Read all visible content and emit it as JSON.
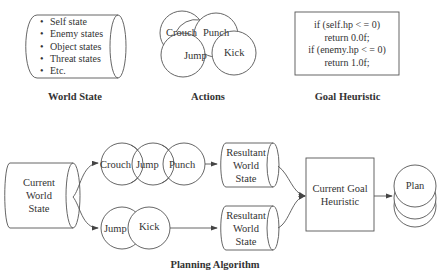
{
  "top": {
    "world_state": {
      "caption": "World State",
      "items": [
        "Self state",
        "Enemy states",
        "Object states",
        "Threat states",
        "Etc."
      ]
    },
    "actions": {
      "caption": "Actions",
      "nodes": [
        "Crouch",
        "Punch",
        "Jump",
        "Kick"
      ]
    },
    "goal_heuristic": {
      "caption": "Goal Heuristic",
      "code": [
        "if (self.hp < = 0)",
        "return 0.0f;",
        "if (enemy.hp < = 0)",
        "return 1.0f;"
      ]
    }
  },
  "planning": {
    "caption": "Planning Algorithm",
    "current_world_state": [
      "Current",
      "World",
      "State"
    ],
    "sequence_a": [
      "Crouch",
      "Jump",
      "Punch"
    ],
    "sequence_b": [
      "Jump",
      "Kick"
    ],
    "resultant_a": [
      "Resultant",
      "World",
      "State"
    ],
    "resultant_b": [
      "Resultant",
      "World",
      "State"
    ],
    "current_goal_heuristic": [
      "Current Goal",
      "Heuristic"
    ],
    "plan": "Plan"
  },
  "colors": {
    "stroke": "#444444",
    "text": "#333333",
    "background": "#ffffff"
  }
}
